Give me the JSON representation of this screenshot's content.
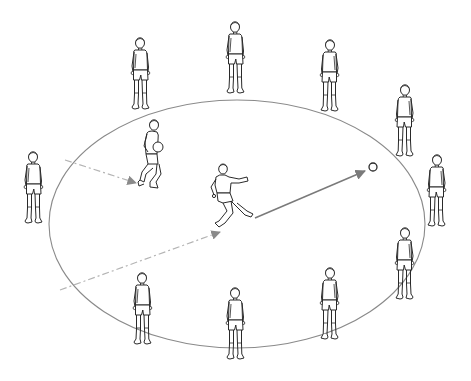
{
  "diagram": {
    "type": "football-drill-illustration",
    "colors": {
      "background": "#ffffff",
      "figure_stroke": "#2a2a2a",
      "ellipse_stroke": "#8a8a8a",
      "solid_arrow": "#7a7a7a",
      "dashed_arrow": "#b4b4b4"
    },
    "ellipse": {
      "cx": 237,
      "cy": 224,
      "rx": 188,
      "ry": 124
    },
    "ball": {
      "cx": 373,
      "cy": 167,
      "r": 4
    },
    "outer_players": [
      {
        "id": "top-left",
        "x": 140,
        "y": 38,
        "facing": "right"
      },
      {
        "id": "top-center",
        "x": 235,
        "y": 22,
        "facing": "front"
      },
      {
        "id": "top-right",
        "x": 330,
        "y": 40,
        "facing": "left"
      },
      {
        "id": "right-upper",
        "x": 405,
        "y": 85,
        "facing": "left"
      },
      {
        "id": "right",
        "x": 437,
        "y": 155,
        "facing": "left"
      },
      {
        "id": "right-lower",
        "x": 405,
        "y": 228,
        "facing": "left"
      },
      {
        "id": "bottom-right",
        "x": 330,
        "y": 268,
        "facing": "left"
      },
      {
        "id": "bottom-center",
        "x": 235,
        "y": 288,
        "facing": "back"
      },
      {
        "id": "bottom-left",
        "x": 142,
        "y": 273,
        "facing": "right"
      },
      {
        "id": "left",
        "x": 33,
        "y": 152,
        "facing": "right"
      }
    ],
    "inner_players": [
      {
        "id": "ball-carrier",
        "x": 152,
        "y": 120,
        "action": "running with ball in hands"
      },
      {
        "id": "kicker",
        "x": 225,
        "y": 163,
        "action": "kicking"
      }
    ],
    "arrows": [
      {
        "id": "dashed-arrow-upper",
        "style": "dashed",
        "x1": 65,
        "y1": 160,
        "x2": 136,
        "y2": 183
      },
      {
        "id": "dashed-arrow-lower",
        "style": "dashed",
        "x1": 60,
        "y1": 290,
        "x2": 220,
        "y2": 232
      },
      {
        "id": "pass-arrow",
        "style": "solid",
        "x1": 255,
        "y1": 218,
        "x2": 365,
        "y2": 171
      }
    ]
  }
}
